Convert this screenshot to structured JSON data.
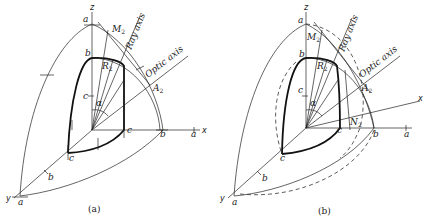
{
  "figure": {
    "panels": [
      {
        "id": "a",
        "caption": "(a)",
        "axes": {
          "z": "z",
          "x": "x",
          "y": "y"
        },
        "intercepts": {
          "z_axis": [
            "a",
            "b",
            "c"
          ],
          "x_axis": [
            "c",
            "b",
            "a"
          ],
          "y_axis": [
            "c",
            "b",
            "a"
          ]
        },
        "points": {
          "M": "M",
          "M_sub": "2",
          "R": "R",
          "R_sub": "2",
          "A": "A",
          "A_sub": "2"
        },
        "lines": {
          "ray_axis": "Ray axis",
          "optic_axis": "Optic axis"
        },
        "angle": "α"
      },
      {
        "id": "b",
        "caption": "(b)",
        "axes": {
          "z": "z",
          "x": "x",
          "y": "y"
        },
        "intercepts": {
          "z_axis": [
            "a",
            "b",
            "c"
          ],
          "x_axis": [
            "c",
            "b",
            "a"
          ],
          "y_axis": [
            "c",
            "b",
            "a"
          ]
        },
        "points": {
          "M": "M",
          "M_sub": "2",
          "R": "R",
          "R_sub": "2",
          "A": "A",
          "A_sub": "2",
          "N": "N",
          "N_sub": "2"
        },
        "lines": {
          "ray_axis": "Ray axis",
          "optic_axis": "Optic axis"
        },
        "angle": "α"
      }
    ],
    "colors": {
      "ink": "#1a1a1a",
      "paper": "#ffffff"
    }
  }
}
